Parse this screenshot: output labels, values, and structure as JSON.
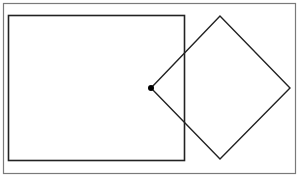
{
  "diagram": {
    "colors": {
      "background": "#ffffff",
      "frame": "#7a7a7a",
      "stroke": "#222222",
      "dot": "#000000"
    },
    "frame": {
      "x": 3,
      "y": 3,
      "w": 292,
      "h": 170
    },
    "rectangle": {
      "x": 8,
      "y": 15,
      "w": 176,
      "h": 145
    },
    "diamond": {
      "points": [
        [
          151,
          88
        ],
        [
          220,
          16
        ],
        [
          290,
          88
        ],
        [
          220,
          159
        ]
      ]
    },
    "dot": {
      "cx": 151,
      "cy": 88,
      "r": 3
    }
  }
}
